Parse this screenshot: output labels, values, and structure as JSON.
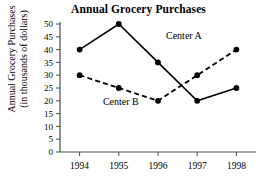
{
  "chart_data": {
    "type": "line",
    "title": "Annual Grocery Purchases",
    "xlabel": "",
    "ylabel": "Annual Grocery Purchases (in thousands of dollars)",
    "ylabel_line1": "Annual Grocery Purchases",
    "ylabel_line2": "(in thousands of dollars)",
    "categories": [
      "1994",
      "1995",
      "1996",
      "1997",
      "1998"
    ],
    "x": [
      1994,
      1995,
      1996,
      1997,
      1998
    ],
    "ylim": [
      0,
      50
    ],
    "ytick_labels": [
      "0",
      "5",
      "10",
      "15",
      "20",
      "25",
      "30",
      "35",
      "40",
      "45",
      "50"
    ],
    "yticks": [
      0,
      5,
      10,
      15,
      20,
      25,
      30,
      35,
      40,
      45,
      50
    ],
    "grid": false,
    "legend_position": "inline-annotation",
    "series": [
      {
        "name": "Center A",
        "values": [
          40,
          50,
          35,
          20,
          25
        ],
        "style": "solid",
        "color": "#000000",
        "label_text": "Center A"
      },
      {
        "name": "Center B",
        "values": [
          30,
          25,
          20,
          30,
          40
        ],
        "style": "dashed",
        "color": "#000000",
        "label_text": "Center B"
      }
    ],
    "annotations": [
      {
        "text": "Center A",
        "series": "Center A"
      },
      {
        "text": "Center B",
        "series": "Center B"
      }
    ]
  }
}
